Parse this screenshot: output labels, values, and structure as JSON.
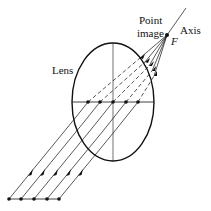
{
  "diagram": {
    "labels": {
      "lens": "Lens",
      "point_image_line1": "Point",
      "point_image_line2": "image",
      "axis": "Axis",
      "focal_point": "F"
    },
    "colors": {
      "stroke": "#111111",
      "background": "#ffffff"
    },
    "geometry": {
      "lens": {
        "cx": 113,
        "cy": 102,
        "rx": 41,
        "ry": 59
      },
      "focal_point": {
        "x": 167,
        "y": 35
      },
      "axis_end": {
        "x": 186,
        "y": 8
      },
      "lens_plane_dots_x": [
        88,
        100,
        113,
        126,
        138
      ],
      "source_dots_y": 199,
      "source_dots_x": [
        9,
        21,
        34,
        47,
        59
      ],
      "ray_count": 5
    }
  }
}
